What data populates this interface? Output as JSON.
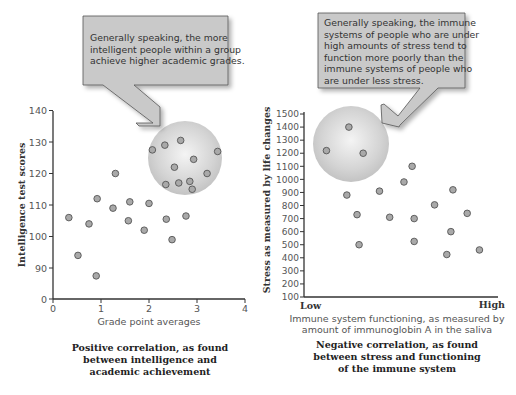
{
  "chart_data": [
    {
      "type": "scatter",
      "title": "Positive correlation, as found between intelligence and academic achievement",
      "caption_lines": [
        "Positive correlation, as found",
        "between intelligence and",
        "academic achievement"
      ],
      "xlabel": "Grade point averages",
      "ylabel": "Intelligence test scores",
      "xlim": [
        0,
        4
      ],
      "ylim": [
        0,
        140
      ],
      "x_ticks": [
        "0",
        "1",
        "2",
        "3",
        "4"
      ],
      "y_ticks": [
        "0",
        "90",
        "100",
        "110",
        "120",
        "130",
        "140"
      ],
      "axis_break": "y axis jumps from 0 to 90",
      "grid": false,
      "callout": {
        "lines": [
          "Generally speaking, the more",
          "intelligent people within a group",
          "achieve higher academic grades."
        ]
      },
      "points": [
        {
          "x": 0.33,
          "y": 106
        },
        {
          "x": 0.52,
          "y": 94
        },
        {
          "x": 0.75,
          "y": 104
        },
        {
          "x": 0.9,
          "y": 87.5
        },
        {
          "x": 0.92,
          "y": 112
        },
        {
          "x": 1.25,
          "y": 109
        },
        {
          "x": 1.3,
          "y": 120
        },
        {
          "x": 1.57,
          "y": 105
        },
        {
          "x": 1.6,
          "y": 111
        },
        {
          "x": 1.9,
          "y": 102
        },
        {
          "x": 2.0,
          "y": 110.5
        },
        {
          "x": 2.36,
          "y": 105.5
        },
        {
          "x": 2.48,
          "y": 99
        },
        {
          "x": 2.77,
          "y": 106.5
        },
        {
          "x": 2.07,
          "y": 127.5
        },
        {
          "x": 2.33,
          "y": 129
        },
        {
          "x": 2.66,
          "y": 130.5
        },
        {
          "x": 3.43,
          "y": 127
        },
        {
          "x": 2.53,
          "y": 122
        },
        {
          "x": 2.93,
          "y": 124.5
        },
        {
          "x": 3.21,
          "y": 120
        },
        {
          "x": 2.35,
          "y": 116.5
        },
        {
          "x": 2.62,
          "y": 117
        },
        {
          "x": 2.85,
          "y": 117.5
        },
        {
          "x": 2.9,
          "y": 115
        }
      ],
      "highlight_circle": {
        "center_x": 2.75,
        "center_y": 123,
        "note": "highlights high GPA / high IQ cluster"
      }
    },
    {
      "type": "scatter",
      "title": "Negative correlation, as found between stress and functioning of the immune system",
      "caption_lines": [
        "Negative correlation, as found",
        "between stress and functioning",
        "of the immune system"
      ],
      "xlabel_lines": [
        "Immune system functioning, as measured by",
        "amount of immunoglobin A in the saliva"
      ],
      "x_endpoints": [
        "Low",
        "High"
      ],
      "ylabel": "Stress as measured by life changes",
      "xlim": [
        0,
        100
      ],
      "ylim": [
        100,
        1500
      ],
      "y_ticks": [
        "100",
        "200",
        "300",
        "400",
        "500",
        "600",
        "700",
        "800",
        "900",
        "1000",
        "1100",
        "1200",
        "1300",
        "1400",
        "1500"
      ],
      "grid": false,
      "callout": {
        "lines": [
          "Generally speaking, the immune",
          "systems of people who are under",
          "high amounts of stress tend to",
          "function more poorly than the",
          "immune systems of people who",
          "are under less stress."
        ]
      },
      "points": [
        {
          "x": 11,
          "y": 1220
        },
        {
          "x": 22,
          "y": 1400
        },
        {
          "x": 29,
          "y": 1200
        },
        {
          "x": 21,
          "y": 880
        },
        {
          "x": 26,
          "y": 730
        },
        {
          "x": 27,
          "y": 500
        },
        {
          "x": 37,
          "y": 910
        },
        {
          "x": 42,
          "y": 710
        },
        {
          "x": 49,
          "y": 980
        },
        {
          "x": 53,
          "y": 1100
        },
        {
          "x": 54,
          "y": 700
        },
        {
          "x": 54,
          "y": 525
        },
        {
          "x": 64,
          "y": 805
        },
        {
          "x": 70,
          "y": 425
        },
        {
          "x": 72,
          "y": 600
        },
        {
          "x": 73,
          "y": 920
        },
        {
          "x": 80,
          "y": 740
        },
        {
          "x": 86,
          "y": 460
        }
      ],
      "highlight_circle": {
        "center_x": 22,
        "center_y": 1270,
        "note": "highlights high stress / low immune functioning cluster"
      }
    }
  ]
}
